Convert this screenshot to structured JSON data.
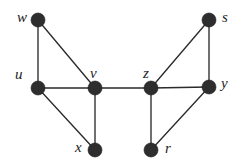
{
  "figure": {
    "kind": "undirected-graph-diagram",
    "background_color": "#ffffff",
    "node_color": "#2e2e2e",
    "edge_color": "#2b2b2b",
    "label_color": "#1d1d1d",
    "width": 245,
    "height": 166
  },
  "graph": {
    "node_radius": 7,
    "nodes": [
      {
        "id": "w",
        "label": "w",
        "cx": 38,
        "cy": 20,
        "label_x": 17,
        "label_y": 10
      },
      {
        "id": "s",
        "label": "s",
        "cx": 209,
        "cy": 20,
        "label_x": 222,
        "label_y": 10
      },
      {
        "id": "u",
        "label": "u",
        "cx": 38,
        "cy": 88,
        "label_x": 15,
        "label_y": 67
      },
      {
        "id": "v",
        "label": "v",
        "cx": 95,
        "cy": 88,
        "label_x": 90,
        "label_y": 66
      },
      {
        "id": "z",
        "label": "z",
        "cx": 151,
        "cy": 88,
        "label_x": 143,
        "label_y": 66
      },
      {
        "id": "y",
        "label": "y",
        "cx": 209,
        "cy": 87,
        "label_x": 221,
        "label_y": 76
      },
      {
        "id": "x",
        "label": "x",
        "cx": 95,
        "cy": 150,
        "label_x": 75,
        "label_y": 140
      },
      {
        "id": "r",
        "label": "r",
        "cx": 151,
        "cy": 150,
        "label_x": 165,
        "label_y": 141
      }
    ],
    "edges": [
      {
        "from": "w",
        "to": "u"
      },
      {
        "from": "w",
        "to": "v"
      },
      {
        "from": "u",
        "to": "v"
      },
      {
        "from": "u",
        "to": "x"
      },
      {
        "from": "v",
        "to": "x"
      },
      {
        "from": "v",
        "to": "z"
      },
      {
        "from": "z",
        "to": "s"
      },
      {
        "from": "z",
        "to": "y"
      },
      {
        "from": "z",
        "to": "r"
      },
      {
        "from": "s",
        "to": "y"
      },
      {
        "from": "r",
        "to": "y"
      }
    ]
  }
}
